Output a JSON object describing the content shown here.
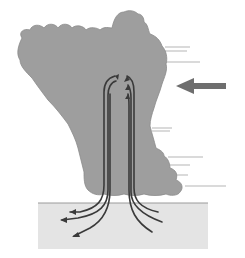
{
  "diagram": {
    "title": "",
    "colors": {
      "background": "#ffffff",
      "cloud": "#9e9e9e",
      "cloud_edge": "#8a8a8a",
      "ground": "#e4e4e4",
      "ground_line": "#9a9a9a",
      "flow_lines": "#3a3a3a",
      "wind_arrow": "#6e6e6e",
      "wind_streaks": "#b5b5b5"
    },
    "elements": [
      {
        "name": "storm-cloud",
        "description": "Large gray cumulonimbus cloud, wide top narrowing toward bottom right"
      },
      {
        "name": "downdraft-lines",
        "description": "Two bundles of dark flow lines descending from inside the cloud to the ground, curled at the top"
      },
      {
        "name": "outflow-arrows",
        "description": "Flow lines spreading horizontally left and right near the ground with arrowheads"
      },
      {
        "name": "ground-surface",
        "description": "Light gray rectangle representing the ground"
      },
      {
        "name": "wind-arrow",
        "description": "Large gray arrow on the right pointing left toward the cloud"
      },
      {
        "name": "wind-streaks",
        "description": "Thin horizontal streak lines trailing from the right edge of the cloud"
      }
    ],
    "labels": []
  }
}
